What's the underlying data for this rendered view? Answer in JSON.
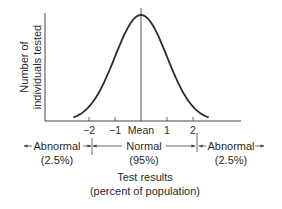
{
  "chart_data": {
    "type": "line",
    "title": "",
    "ylabel_lines": [
      "Number of",
      "individuals tested"
    ],
    "xlabel_lines": [
      "Test results",
      "(percent of population)"
    ],
    "x_ticks": [
      {
        "value": -2,
        "label": "−2"
      },
      {
        "value": -1,
        "label": "−1"
      },
      {
        "value": 0,
        "label": "Mean"
      },
      {
        "value": 1,
        "label": "1"
      },
      {
        "value": 2,
        "label": "2"
      }
    ],
    "xlim": [
      -3.9,
      4.0
    ],
    "curve": {
      "distribution": "normal",
      "mean": 0,
      "sd": 1,
      "x_range": [
        -2.6,
        2.6
      ]
    },
    "regions": [
      {
        "name": "left",
        "label": "Abnormal",
        "percent": "(2.5%)",
        "range": [
          null,
          -2
        ]
      },
      {
        "name": "center",
        "label": "Normal",
        "percent": "(95%)",
        "range": [
          -2,
          2
        ]
      },
      {
        "name": "right",
        "label": "Abnormal",
        "percent": "(2.5%)",
        "range": [
          2,
          null
        ]
      }
    ],
    "grid": false,
    "legend": "none"
  }
}
